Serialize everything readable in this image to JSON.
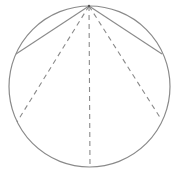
{
  "diagram": {
    "type": "geometry",
    "stroke_color": "#8a8a8a",
    "circle": {
      "cx": 89.5,
      "cy": 86.5,
      "r": 80.5
    },
    "apex": {
      "x": 89,
      "y": 6
    },
    "solid_chords": [
      {
        "name": "left-solid-chord",
        "x2": 16,
        "y2": 54
      },
      {
        "name": "right-solid-chord",
        "x2": 162,
        "y2": 54
      }
    ],
    "dashed_chords": [
      {
        "name": "left-dashed-chord",
        "x2": 17,
        "y2": 122
      },
      {
        "name": "center-dashed-chord",
        "x2": 90,
        "y2": 167
      },
      {
        "name": "right-dashed-chord",
        "x2": 161,
        "y2": 119
      }
    ]
  }
}
